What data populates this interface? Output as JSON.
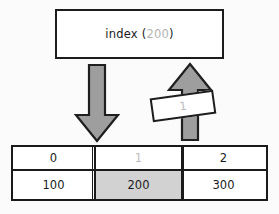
{
  "diagram": {
    "title_text": "index (200)",
    "background_color": "#fbfbfb",
    "expression": {
      "label": "index",
      "open_paren": " (",
      "argument": "200",
      "close_paren": ")",
      "argument_color": "#b3b3b3",
      "text_color": "#1b1b1b"
    },
    "arrow_down": {
      "name": "index-lookup-arrow",
      "direction": "down",
      "fill_color": "#9e9e9e",
      "stroke_color": "#1f1f1f"
    },
    "arrow_up": {
      "name": "return-value-arrow",
      "direction": "up",
      "fill_color": "#9e9e9e",
      "stroke_color": "#1f1f1f"
    },
    "tag": {
      "value": "1",
      "text_color": "#bdbdbd",
      "rotation_degrees": -8
    },
    "array": {
      "index_header_color": "#1b1b1b",
      "highlight_index": 1,
      "highlight_fill": "#d2d2d2",
      "highlight_index_text_color": "#bdbdbd",
      "columns": [
        {
          "index": "0",
          "value": "100",
          "highlighted": false
        },
        {
          "index": "1",
          "value": "200",
          "highlighted": true
        },
        {
          "index": "2",
          "value": "300",
          "highlighted": false
        }
      ]
    }
  }
}
